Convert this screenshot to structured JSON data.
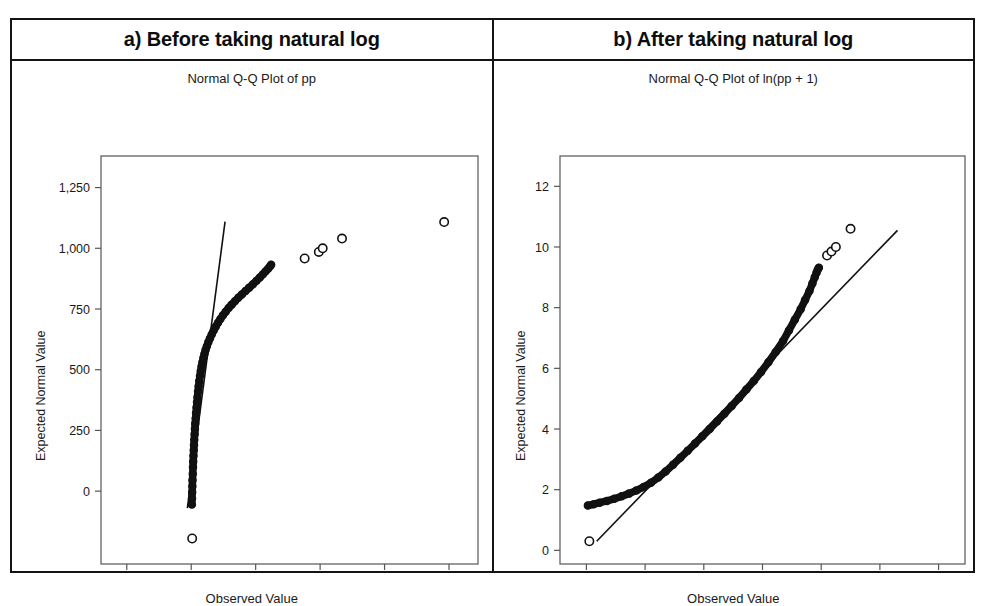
{
  "figure": {
    "panels": [
      {
        "header": "a) Before taking natural log",
        "plot_title": "Normal Q-Q Plot of pp",
        "xlabel": "Observed Value",
        "ylabel": "Expected Normal Value"
      },
      {
        "header": "b) After taking natural log",
        "plot_title": "Normal Q-Q Plot of ln(pp + 1)",
        "xlabel": "Observed Value",
        "ylabel": "Expected Normal Value"
      }
    ]
  },
  "chart_data": [
    {
      "type": "scatter",
      "title": "Normal Q-Q Plot of pp",
      "panel_label": "a) Before taking natural log",
      "xlabel": "Observed Value",
      "ylabel": "Expected Normal Value",
      "xlim": [
        -2800,
        8900
      ],
      "ylim": [
        -300,
        1380
      ],
      "xticks": [
        -2000,
        0,
        2000,
        4000,
        6000,
        8000
      ],
      "xticklabels": [
        "-2,000",
        "0",
        "2,000",
        "4,000",
        "6,000",
        "8,000"
      ],
      "yticks": [
        0,
        250,
        500,
        750,
        1000,
        1250
      ],
      "yticklabels": [
        "0",
        "250",
        "500",
        "750",
        "1,000",
        "1,250"
      ],
      "grid": false,
      "legend": null,
      "marker": "open-circle",
      "reference_line": {
        "x": [
          -120,
          1050
        ],
        "y": [
          -70,
          1110
        ],
        "style": "solid-thin"
      },
      "series": [
        {
          "name": "Q-Q points (dense band)",
          "x": [
            20,
            25,
            30,
            35,
            40,
            48,
            55,
            62,
            70,
            78,
            86,
            95,
            105,
            115,
            125,
            138,
            150,
            165,
            180,
            195,
            212,
            230,
            250,
            272,
            295,
            320,
            348,
            378,
            410,
            445,
            485,
            530,
            580,
            635,
            695,
            760,
            830,
            905,
            985,
            1070,
            1160,
            1255,
            1355,
            1460,
            1570,
            1685,
            1800,
            1915,
            2025,
            2130,
            2225,
            2310,
            2385,
            2440,
            2480
          ],
          "y": [
            -55,
            -30,
            -5,
            20,
            45,
            72,
            98,
            122,
            146,
            168,
            190,
            212,
            234,
            256,
            278,
            300,
            322,
            344,
            366,
            388,
            410,
            432,
            453,
            474,
            494,
            513,
            531,
            548,
            565,
            581,
            597,
            613,
            629,
            645,
            661,
            677,
            693,
            709,
            724,
            739,
            754,
            768,
            782,
            796,
            810,
            824,
            838,
            852,
            866,
            880,
            893,
            905,
            916,
            925,
            932
          ]
        },
        {
          "name": "Upper outliers",
          "x": [
            3520,
            3960,
            4080,
            4680,
            7850
          ],
          "y": [
            958,
            985,
            1000,
            1040,
            1108
          ]
        },
        {
          "name": "Lower outlier",
          "x": [
            30
          ],
          "y": [
            -195
          ]
        }
      ]
    },
    {
      "type": "scatter",
      "title": "Normal Q-Q Plot of ln(pp + 1)",
      "panel_label": "b) After taking natural log",
      "xlabel": "Observed Value",
      "ylabel": "Expected Normal Value",
      "xlim": [
        -0.9,
        12.9
      ],
      "ylim": [
        -0.45,
        13.0
      ],
      "xticks": [
        0,
        2,
        4,
        6,
        8,
        10,
        12
      ],
      "xticklabels": [
        "0",
        "2",
        "4",
        "6",
        "8",
        "10",
        "12"
      ],
      "yticks": [
        0,
        2,
        4,
        6,
        8,
        10,
        12
      ],
      "yticklabels": [
        "0",
        "2",
        "4",
        "6",
        "8",
        "10",
        "12"
      ],
      "grid": false,
      "legend": null,
      "marker": "open-circle",
      "reference_line": {
        "x": [
          0.35,
          10.6
        ],
        "y": [
          0.3,
          10.55
        ],
        "style": "solid-thin"
      },
      "series": [
        {
          "name": "Q-Q points (dense band)",
          "x": [
            0.05,
            0.25,
            0.45,
            0.7,
            0.95,
            1.2,
            1.45,
            1.7,
            1.95,
            2.2,
            2.45,
            2.7,
            2.95,
            3.2,
            3.45,
            3.7,
            3.95,
            4.2,
            4.45,
            4.7,
            4.95,
            5.2,
            5.45,
            5.7,
            5.95,
            6.2,
            6.45,
            6.7,
            6.9,
            7.1,
            7.3,
            7.45,
            7.6,
            7.7,
            7.78,
            7.84,
            7.88,
            7.92
          ],
          "y": [
            1.48,
            1.52,
            1.57,
            1.63,
            1.7,
            1.78,
            1.87,
            1.97,
            2.09,
            2.23,
            2.4,
            2.6,
            2.82,
            3.05,
            3.28,
            3.52,
            3.76,
            4.0,
            4.25,
            4.5,
            4.76,
            5.02,
            5.3,
            5.58,
            5.88,
            6.2,
            6.54,
            6.9,
            7.25,
            7.6,
            7.95,
            8.25,
            8.55,
            8.8,
            9.0,
            9.15,
            9.25,
            9.32
          ]
        },
        {
          "name": "Upper outliers",
          "x": [
            8.2,
            8.35,
            8.5,
            9.0
          ],
          "y": [
            9.72,
            9.85,
            10.0,
            10.6
          ]
        },
        {
          "name": "Lower outlier",
          "x": [
            0.1
          ],
          "y": [
            0.3
          ]
        }
      ]
    }
  ]
}
